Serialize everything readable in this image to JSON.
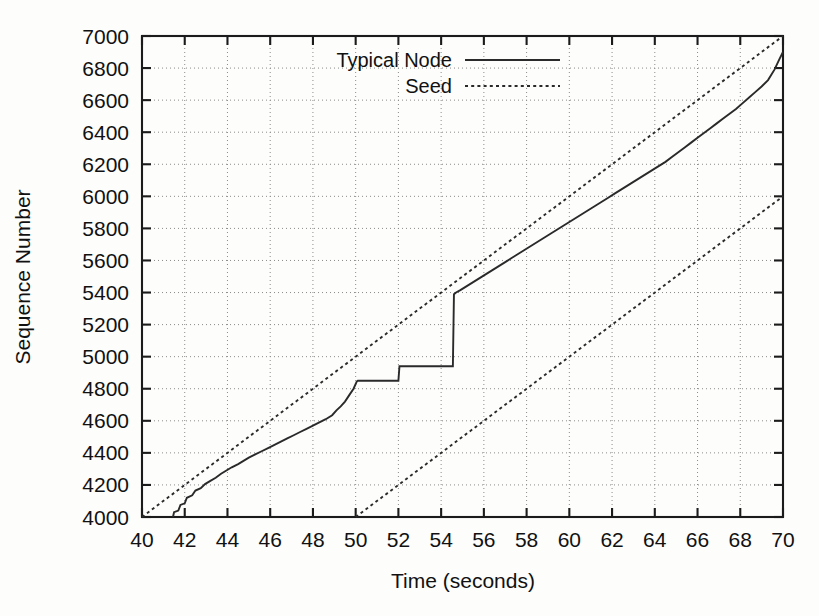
{
  "chart_data": {
    "type": "line",
    "title": "",
    "xlabel": "Time (seconds)",
    "ylabel": "Sequence Number",
    "xlim": [
      40,
      70
    ],
    "ylim": [
      4000,
      7000
    ],
    "grid": true,
    "legend_position": "top-center",
    "xticks": [
      40,
      42,
      44,
      46,
      48,
      50,
      52,
      54,
      56,
      58,
      60,
      62,
      64,
      66,
      68,
      70
    ],
    "xtick_labels": [
      "40",
      "42",
      "44",
      "46",
      "48",
      "50",
      "52",
      "54",
      "56",
      "58",
      "60",
      "62",
      "64",
      "66",
      "68",
      "70"
    ],
    "yticks": [
      4000,
      4200,
      4400,
      4600,
      4800,
      5000,
      5200,
      5400,
      5600,
      5800,
      6000,
      6200,
      6400,
      6600,
      6800,
      7000
    ],
    "ytick_labels": [
      "4000",
      "4200",
      "4400",
      "4600",
      "4800",
      "5000",
      "5200",
      "5400",
      "5600",
      "5800",
      "6000",
      "6200",
      "6400",
      "6600",
      "6800",
      "7000"
    ],
    "legend": [
      {
        "name": "Typical Node",
        "style": "solid"
      },
      {
        "name": "Seed",
        "style": "dotted"
      }
    ],
    "series": [
      {
        "name": "Seed",
        "style": "dotted",
        "comment": "Upper seed reference line, slope 100 seq/sec",
        "points": [
          [
            40,
            4000
          ],
          [
            70,
            7000
          ]
        ]
      },
      {
        "name": "Seed",
        "style": "dotted",
        "comment": "Lower seed reference line, same slope, offset +10 s",
        "points": [
          [
            50,
            4000
          ],
          [
            70,
            6000
          ]
        ]
      },
      {
        "name": "Typical Node",
        "style": "solid",
        "comment": "Stair-stepped receiver trace with two stall plateaus and a burst catch-up",
        "points": [
          [
            41.45,
            4000
          ],
          [
            41.5,
            4030
          ],
          [
            41.7,
            4040
          ],
          [
            41.8,
            4075
          ],
          [
            42.0,
            4085
          ],
          [
            42.1,
            4120
          ],
          [
            42.35,
            4135
          ],
          [
            42.5,
            4165
          ],
          [
            42.75,
            4180
          ],
          [
            42.95,
            4205
          ],
          [
            43.2,
            4225
          ],
          [
            43.45,
            4245
          ],
          [
            43.7,
            4270
          ],
          [
            43.95,
            4290
          ],
          [
            44.2,
            4310
          ],
          [
            44.5,
            4330
          ],
          [
            44.75,
            4350
          ],
          [
            45.0,
            4370
          ],
          [
            45.3,
            4390
          ],
          [
            45.6,
            4410
          ],
          [
            45.9,
            4430
          ],
          [
            46.2,
            4450
          ],
          [
            46.5,
            4470
          ],
          [
            46.8,
            4490
          ],
          [
            47.1,
            4510
          ],
          [
            47.4,
            4530
          ],
          [
            47.7,
            4550
          ],
          [
            48.0,
            4570
          ],
          [
            48.3,
            4590
          ],
          [
            48.6,
            4610
          ],
          [
            48.9,
            4635
          ],
          [
            49.1,
            4665
          ],
          [
            49.3,
            4690
          ],
          [
            49.5,
            4720
          ],
          [
            49.7,
            4760
          ],
          [
            49.9,
            4800
          ],
          [
            50.05,
            4845
          ],
          [
            50.1,
            4850
          ],
          [
            52.0,
            4850
          ],
          [
            52.05,
            4940
          ],
          [
            54.55,
            4940
          ],
          [
            54.6,
            5390
          ],
          [
            54.7,
            5400
          ],
          [
            54.9,
            5415
          ],
          [
            55.2,
            5440
          ],
          [
            55.5,
            5465
          ],
          [
            55.8,
            5490
          ],
          [
            56.1,
            5515
          ],
          [
            56.4,
            5540
          ],
          [
            56.7,
            5565
          ],
          [
            57.0,
            5590
          ],
          [
            57.3,
            5615
          ],
          [
            57.6,
            5640
          ],
          [
            57.9,
            5665
          ],
          [
            58.2,
            5690
          ],
          [
            58.5,
            5715
          ],
          [
            58.8,
            5740
          ],
          [
            59.1,
            5765
          ],
          [
            59.4,
            5790
          ],
          [
            59.7,
            5815
          ],
          [
            60.0,
            5840
          ],
          [
            60.3,
            5865
          ],
          [
            60.6,
            5890
          ],
          [
            60.9,
            5915
          ],
          [
            61.2,
            5940
          ],
          [
            61.5,
            5965
          ],
          [
            61.8,
            5990
          ],
          [
            62.1,
            6015
          ],
          [
            62.4,
            6040
          ],
          [
            62.7,
            6065
          ],
          [
            63.0,
            6090
          ],
          [
            63.3,
            6115
          ],
          [
            63.6,
            6140
          ],
          [
            63.9,
            6165
          ],
          [
            64.2,
            6190
          ],
          [
            64.5,
            6215
          ],
          [
            64.8,
            6245
          ],
          [
            65.1,
            6275
          ],
          [
            65.4,
            6305
          ],
          [
            65.7,
            6335
          ],
          [
            66.0,
            6365
          ],
          [
            66.3,
            6395
          ],
          [
            66.6,
            6425
          ],
          [
            66.9,
            6455
          ],
          [
            67.2,
            6485
          ],
          [
            67.5,
            6515
          ],
          [
            67.8,
            6545
          ],
          [
            68.1,
            6580
          ],
          [
            68.4,
            6615
          ],
          [
            68.7,
            6650
          ],
          [
            69.0,
            6685
          ],
          [
            69.3,
            6725
          ],
          [
            69.6,
            6790
          ],
          [
            69.85,
            6860
          ],
          [
            70.0,
            6900
          ]
        ]
      }
    ]
  }
}
